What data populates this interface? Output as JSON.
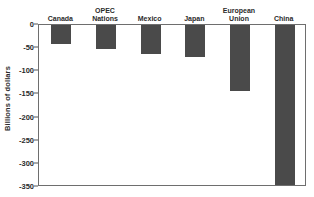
{
  "chart_data": {
    "type": "bar",
    "title": "",
    "subtitle": "",
    "xlabel": "",
    "ylabel": "Billions of dollars",
    "categories": [
      "Canada",
      "OPEC\nNations",
      "Mexico",
      "Japan",
      "European\nUnion",
      "China"
    ],
    "values": [
      -41,
      -52,
      -62,
      -70,
      -143,
      -345
    ],
    "ylim": [
      -350,
      0
    ],
    "yticks": [
      0,
      -50,
      -100,
      -150,
      -200,
      -250,
      -300,
      -350
    ],
    "ytick_labels": [
      "0",
      "-50",
      "-100",
      "-150",
      "-200",
      "-250",
      "-300",
      "-350"
    ],
    "grid": false,
    "legend": null,
    "orientation": "vertical",
    "bar_color": "#4a4a4a",
    "axis_color": "#6e6e6e",
    "text_color": "#2b2b2b",
    "background": "#ffffff",
    "category_labels_position": "above-zero-line"
  }
}
